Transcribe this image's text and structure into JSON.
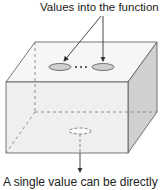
{
  "diagram": {
    "top_label": "Values into the function",
    "bottom_label": "A single value can be directly",
    "ellipsis": "…",
    "colors": {
      "front_face": "#efefef",
      "top_face": "#f6f6f6",
      "side_face": "#d0d0d0",
      "stroke": "#555555",
      "inlet_fill": "#cfcfcf"
    }
  }
}
